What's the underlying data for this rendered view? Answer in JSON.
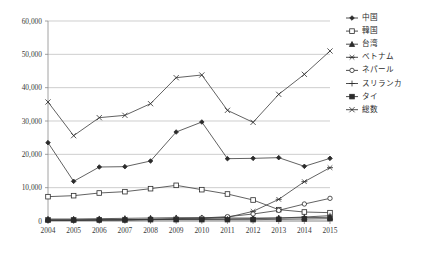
{
  "chart_data": {
    "type": "line",
    "title": "",
    "xlabel": "",
    "ylabel": "",
    "grid": true,
    "legend_position": "right",
    "ylim": [
      0,
      60000
    ],
    "ytick_values": [
      0,
      10000,
      20000,
      30000,
      40000,
      50000,
      60000
    ],
    "ytick_labels": [
      "0",
      "10,000",
      "20,000",
      "30,000",
      "40,000",
      "50,000",
      "60,000"
    ],
    "categories": [
      "2004",
      "2005",
      "2006",
      "2007",
      "2008",
      "2009",
      "2010",
      "2011",
      "2012",
      "2013",
      "2014",
      "2015"
    ],
    "series": [
      {
        "name": "中国",
        "marker": "diamond",
        "values": [
          23500,
          11900,
          16200,
          16300,
          18000,
          26700,
          29700,
          18700,
          18800,
          19000,
          16400,
          18800
        ]
      },
      {
        "name": "韓国",
        "marker": "square-open",
        "values": [
          7300,
          7600,
          8400,
          8800,
          9700,
          10700,
          9400,
          8100,
          6300,
          3400,
          2700,
          2500
        ]
      },
      {
        "name": "台湾",
        "marker": "triangle",
        "values": [
          600,
          600,
          700,
          800,
          900,
          1000,
          1000,
          900,
          900,
          900,
          1000,
          1100
        ]
      },
      {
        "name": "ベトナム",
        "marker": "x-bold",
        "values": [
          300,
          300,
          400,
          400,
          500,
          600,
          700,
          1100,
          2900,
          6500,
          11800,
          16000
        ]
      },
      {
        "name": "ネパール",
        "marker": "circle-open",
        "values": [
          200,
          200,
          300,
          400,
          500,
          700,
          900,
          1300,
          2100,
          3200,
          5100,
          6800
        ]
      },
      {
        "name": "スリランカ",
        "marker": "plus",
        "values": [
          200,
          200,
          300,
          300,
          400,
          500,
          500,
          600,
          700,
          900,
          1200,
          1600
        ]
      },
      {
        "name": "タイ",
        "marker": "square-filled",
        "values": [
          300,
          300,
          300,
          300,
          400,
          400,
          400,
          400,
          400,
          500,
          600,
          700
        ]
      },
      {
        "name": "総数",
        "marker": "x-star",
        "values": [
          35700,
          25600,
          31000,
          31700,
          35200,
          43000,
          43800,
          33200,
          29600,
          38000,
          44000,
          51000
        ]
      }
    ]
  }
}
